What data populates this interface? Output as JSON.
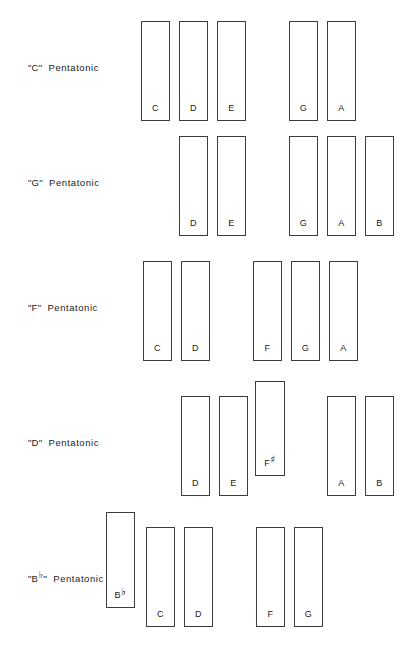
{
  "chart_data": {
    "type": "table",
    "xlabel": "",
    "ylabel": "",
    "grid": false,
    "legend": "none",
    "categories": [
      "\"C\" Pentatonic",
      "\"G\" Pentatonic",
      "\"F\" Pentatonic",
      "\"D\" Pentatonic",
      "\"B♭\" Pentatonic"
    ],
    "series": [
      {
        "name": "\"C\" Pentatonic",
        "values": [
          "C",
          "D",
          "E",
          "G",
          "A"
        ]
      },
      {
        "name": "\"G\" Pentatonic",
        "values": [
          "D",
          "E",
          "G",
          "A",
          "B"
        ]
      },
      {
        "name": "\"F\" Pentatonic",
        "values": [
          "C",
          "D",
          "F",
          "G",
          "A"
        ]
      },
      {
        "name": "\"D\" Pentatonic",
        "values": [
          "D",
          "E",
          "F#",
          "A",
          "B"
        ]
      },
      {
        "name": "\"B♭\" Pentatonic",
        "values": [
          "B♭",
          "C",
          "D",
          "F",
          "G"
        ]
      }
    ]
  },
  "colors": {
    "background": "#ffffff",
    "key_outline": "#3c3c3c",
    "key_fill": "#ffffff",
    "text": "#1b1b1b"
  },
  "rows": [
    {
      "label_root": "C",
      "label_accidental": "",
      "label_suffix": "Pentatonic",
      "label_full": "\"C\"  Pentatonic",
      "label_top": 62,
      "keys": [
        {
          "note": "C",
          "accidental": "",
          "x": 141,
          "y": 21,
          "w": 29,
          "h": 100,
          "raised": false
        },
        {
          "note": "D",
          "accidental": "",
          "x": 179,
          "y": 21,
          "w": 29,
          "h": 100,
          "raised": false
        },
        {
          "note": "E",
          "accidental": "",
          "x": 217,
          "y": 21,
          "w": 29,
          "h": 100,
          "raised": false
        },
        {
          "note": "G",
          "accidental": "",
          "x": 289,
          "y": 21,
          "w": 29,
          "h": 100,
          "raised": false
        },
        {
          "note": "A",
          "accidental": "",
          "x": 327,
          "y": 21,
          "w": 29,
          "h": 100,
          "raised": false
        }
      ]
    },
    {
      "label_root": "G",
      "label_accidental": "",
      "label_suffix": "Pentatonic",
      "label_full": "\"G\"  Pentatonic",
      "label_top": 177,
      "keys": [
        {
          "note": "D",
          "accidental": "",
          "x": 179,
          "y": 136,
          "w": 29,
          "h": 100,
          "raised": false
        },
        {
          "note": "E",
          "accidental": "",
          "x": 217,
          "y": 136,
          "w": 29,
          "h": 100,
          "raised": false
        },
        {
          "note": "G",
          "accidental": "",
          "x": 289,
          "y": 136,
          "w": 29,
          "h": 100,
          "raised": false
        },
        {
          "note": "A",
          "accidental": "",
          "x": 327,
          "y": 136,
          "w": 29,
          "h": 100,
          "raised": false
        },
        {
          "note": "B",
          "accidental": "",
          "x": 365,
          "y": 136,
          "w": 29,
          "h": 100,
          "raised": false
        }
      ]
    },
    {
      "label_root": "F",
      "label_accidental": "",
      "label_suffix": "Pentatonic",
      "label_full": "\"F\"  Pentatonic",
      "label_top": 302,
      "keys": [
        {
          "note": "C",
          "accidental": "",
          "x": 143,
          "y": 261,
          "w": 29,
          "h": 100,
          "raised": false
        },
        {
          "note": "D",
          "accidental": "",
          "x": 181,
          "y": 261,
          "w": 29,
          "h": 100,
          "raised": false
        },
        {
          "note": "F",
          "accidental": "",
          "x": 253,
          "y": 261,
          "w": 29,
          "h": 100,
          "raised": false
        },
        {
          "note": "G",
          "accidental": "",
          "x": 291,
          "y": 261,
          "w": 29,
          "h": 100,
          "raised": false
        },
        {
          "note": "A",
          "accidental": "",
          "x": 329,
          "y": 261,
          "w": 29,
          "h": 100,
          "raised": false
        }
      ]
    },
    {
      "label_root": "D",
      "label_accidental": "",
      "label_suffix": "Pentatonic",
      "label_full": "\"D\"  Pentatonic",
      "label_top": 437,
      "keys": [
        {
          "note": "D",
          "accidental": "",
          "x": 181,
          "y": 396,
          "w": 29,
          "h": 100,
          "raised": false
        },
        {
          "note": "E",
          "accidental": "",
          "x": 219,
          "y": 396,
          "w": 29,
          "h": 100,
          "raised": false
        },
        {
          "note": "F",
          "accidental": "♯",
          "x": 255,
          "y": 381,
          "w": 30,
          "h": 95,
          "raised": true
        },
        {
          "note": "A",
          "accidental": "",
          "x": 327,
          "y": 396,
          "w": 29,
          "h": 100,
          "raised": false
        },
        {
          "note": "B",
          "accidental": "",
          "x": 365,
          "y": 396,
          "w": 29,
          "h": 100,
          "raised": false
        }
      ]
    },
    {
      "label_root": "B",
      "label_accidental": "♭",
      "label_suffix": "Pentatonic",
      "label_full": "\"B♭\"  Pentatonic",
      "label_top": 573,
      "keys": [
        {
          "note": "B",
          "accidental": "♭",
          "x": 106,
          "y": 512,
          "w": 29,
          "h": 96,
          "raised": true
        },
        {
          "note": "C",
          "accidental": "",
          "x": 146,
          "y": 527,
          "w": 29,
          "h": 100,
          "raised": false
        },
        {
          "note": "D",
          "accidental": "",
          "x": 184,
          "y": 527,
          "w": 29,
          "h": 100,
          "raised": false
        },
        {
          "note": "F",
          "accidental": "",
          "x": 256,
          "y": 527,
          "w": 29,
          "h": 100,
          "raised": false
        },
        {
          "note": "G",
          "accidental": "",
          "x": 294,
          "y": 527,
          "w": 29,
          "h": 100,
          "raised": false
        }
      ]
    }
  ]
}
